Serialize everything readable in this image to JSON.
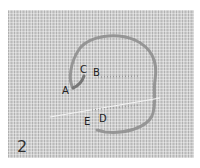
{
  "figure": {
    "step_number": "2",
    "labels": {
      "a": "A",
      "b": "B",
      "c": "C",
      "d": "D",
      "e": "E"
    },
    "colors": {
      "fabric": "#c9c9c9",
      "stitch_thread": "#8c8c8c",
      "working_thread": "#f4f4f4",
      "label_text": "#222222"
    }
  }
}
